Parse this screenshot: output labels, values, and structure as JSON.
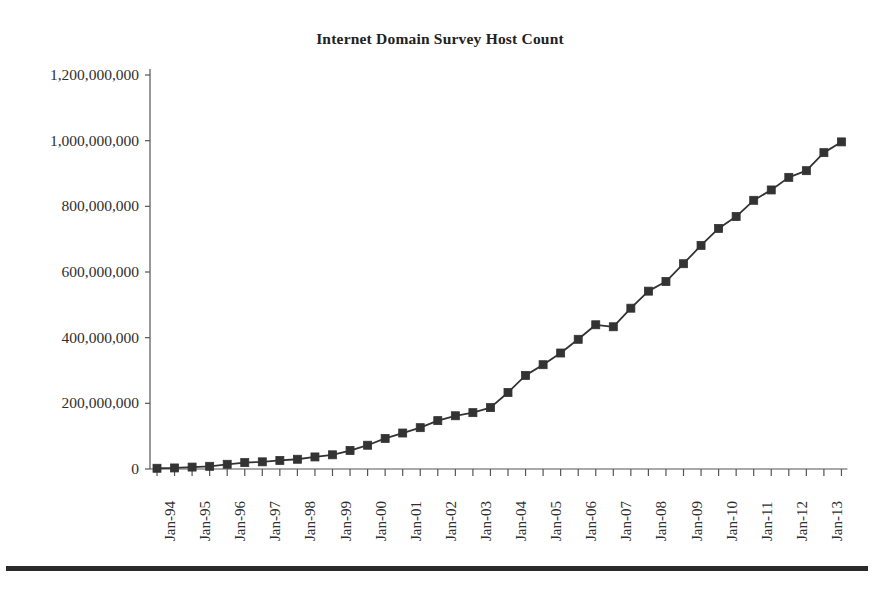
{
  "figure": {
    "title": "Internet Domain Survey Host Count",
    "bottom_rule": "horizontal-rule",
    "line_color": "#333333",
    "marker_color": "#333333",
    "axis_color": "#555555",
    "background": "#ffffff"
  },
  "chart_data": {
    "type": "line",
    "title": "Internet Domain Survey Host Count",
    "xlabel": "",
    "ylabel": "",
    "ylim": [
      0,
      1200000000
    ],
    "ytick_values": [
      0,
      200000000,
      400000000,
      600000000,
      800000000,
      1000000000,
      1200000000
    ],
    "ytick_labels": [
      "0",
      "200,000,000",
      "400,000,000",
      "600,000,000",
      "800,000,000",
      "1,000,000,000",
      "1,200,000,000"
    ],
    "xtick_labels": [
      "Jan-94",
      "Jan-95",
      "Jan-96",
      "Jan-97",
      "Jan-98",
      "Jan-99",
      "Jan-00",
      "Jan-01",
      "Jan-02",
      "Jan-03",
      "Jan-04",
      "Jan-05",
      "Jan-06",
      "Jan-07",
      "Jan-08",
      "Jan-09",
      "Jan-10",
      "Jan-11",
      "Jan-12",
      "Jan-13"
    ],
    "minor_tick_interval_months": 6,
    "grid": false,
    "legend": false,
    "marker": "square",
    "x": [
      "Jan-94",
      "Jul-94",
      "Jan-95",
      "Jul-95",
      "Jan-96",
      "Jul-96",
      "Jan-97",
      "Jul-97",
      "Jan-98",
      "Jul-98",
      "Jan-99",
      "Jul-99",
      "Jan-00",
      "Jul-00",
      "Jan-01",
      "Jul-01",
      "Jan-02",
      "Jul-02",
      "Jan-03",
      "Jul-03",
      "Jan-04",
      "Jul-04",
      "Jan-05",
      "Jul-05",
      "Jan-06",
      "Jul-06",
      "Jan-07",
      "Jul-07",
      "Jan-08",
      "Jul-08",
      "Jan-09",
      "Jul-09",
      "Jan-10",
      "Jul-10",
      "Jan-11",
      "Jul-11",
      "Jan-12",
      "Jul-12",
      "Jan-13",
      "Jul-13"
    ],
    "values": [
      2217000,
      3212000,
      5846000,
      8200000,
      14352000,
      19540000,
      21819000,
      26053000,
      29670000,
      36739000,
      43230000,
      56218000,
      72398000,
      93047000,
      109574000,
      125888000,
      147344000,
      162128000,
      171638000,
      187000000,
      233101000,
      285139000,
      317646000,
      353284000,
      394992000,
      439286000,
      433193000,
      489774000,
      541677000,
      570937000,
      625226000,
      681064000,
      732740000,
      768913000,
      818374000,
      849869000,
      888239000,
      908585000,
      963519000,
      996230000
    ],
    "series": [
      {
        "name": "Host Count",
        "values": [
          2217000,
          3212000,
          5846000,
          8200000,
          14352000,
          19540000,
          21819000,
          26053000,
          29670000,
          36739000,
          43230000,
          56218000,
          72398000,
          93047000,
          109574000,
          125888000,
          147344000,
          162128000,
          171638000,
          187000000,
          233101000,
          285139000,
          317646000,
          353284000,
          394992000,
          439286000,
          433193000,
          489774000,
          541677000,
          570937000,
          625226000,
          681064000,
          732740000,
          768913000,
          818374000,
          849869000,
          888239000,
          908585000,
          963519000,
          996230000
        ]
      }
    ]
  }
}
